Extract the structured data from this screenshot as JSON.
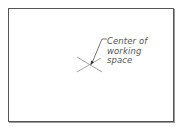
{
  "diagram": {
    "annotation": {
      "lines": [
        "Center of",
        "working",
        "space"
      ]
    },
    "marker": {
      "type": "x-cross",
      "meaning": "center of working space"
    },
    "colors": {
      "line": "#555555",
      "cross": "#999999",
      "background": "#ffffff"
    }
  }
}
